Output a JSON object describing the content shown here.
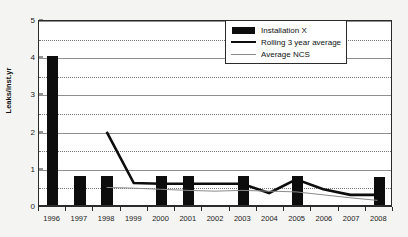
{
  "chart_data": {
    "type": "bar",
    "title": "",
    "xlabel": "",
    "ylabel": "Leaks/inst.yr",
    "ylim": [
      0,
      5
    ],
    "y_ticks": [
      0,
      1,
      2,
      3,
      4,
      5
    ],
    "y_minor_ticks": [
      0.5,
      1.5,
      2.5,
      3.5,
      4.5
    ],
    "grid": true,
    "legend_position": "top-right",
    "categories": [
      "1996",
      "1997",
      "1998",
      "1999",
      "2000",
      "2001",
      "2002",
      "2003",
      "2004",
      "2005",
      "2006",
      "2007",
      "2008"
    ],
    "series": [
      {
        "name": "Installation X",
        "type": "bar",
        "color": "#0d0d0d",
        "values": [
          4.0,
          0.78,
          0.78,
          null,
          0.78,
          0.78,
          null,
          0.78,
          null,
          0.78,
          null,
          null,
          0.75
        ]
      },
      {
        "name": "Rolling 3 year average",
        "type": "line",
        "color": "#0d0d0d",
        "values": [
          null,
          null,
          2.0,
          0.62,
          0.6,
          0.6,
          0.6,
          0.6,
          0.35,
          0.72,
          0.45,
          0.3,
          0.3
        ]
      },
      {
        "name": "Average NCS",
        "type": "line",
        "color": "#8a8a8a",
        "values": [
          null,
          null,
          0.5,
          0.48,
          0.45,
          0.42,
          0.4,
          0.42,
          0.4,
          0.38,
          0.3,
          0.22,
          0.15
        ]
      }
    ]
  },
  "legend": {
    "items": [
      {
        "label": "Installation X",
        "key": "bar-swatch-icon"
      },
      {
        "label": "Rolling 3 year average",
        "key": "thick-line-icon"
      },
      {
        "label": "Average NCS",
        "key": "thin-line-icon"
      }
    ]
  }
}
